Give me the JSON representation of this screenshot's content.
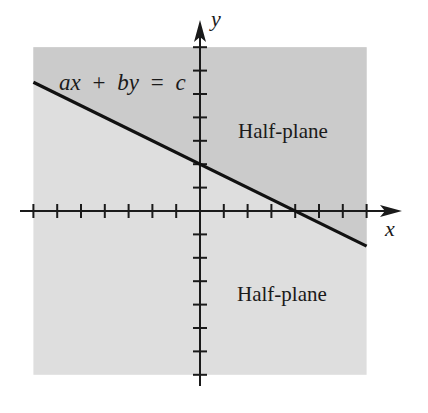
{
  "figure": {
    "width": 428,
    "height": 413,
    "background": "#ffffff",
    "colors": {
      "upper_half_plane": "#cbcbcb",
      "lower_half_plane": "#dedede",
      "line": "#111111",
      "axis": "#1a1a1a",
      "text": "#1a1a1a"
    }
  },
  "labels": {
    "equation": "ax + by = c",
    "equation_parts": [
      "ax",
      "+",
      "by",
      "=",
      "c"
    ],
    "upper_region": "Half-plane",
    "lower_region": "Half-plane",
    "x_axis": "x",
    "y_axis": "y"
  },
  "chart_data": {
    "type": "line",
    "title": "",
    "xlabel": "x",
    "ylabel": "y",
    "xlim": [
      -7,
      7
    ],
    "ylim": [
      -7,
      7
    ],
    "x_ticks": [
      -7,
      -6,
      -5,
      -4,
      -3,
      -2,
      -1,
      1,
      2,
      3,
      4,
      5,
      6,
      7
    ],
    "y_ticks": [
      -7,
      -6,
      -5,
      -4,
      -3,
      -2,
      -1,
      1,
      2,
      3,
      4,
      5,
      6,
      7
    ],
    "tick_labels_shown": false,
    "grid": false,
    "series": [
      {
        "name": "ax + by = c",
        "equation_example": "x + 2y = 4",
        "slope": -0.5,
        "y_intercept": 2,
        "x_intercept": 4,
        "x": [
          -7,
          0,
          4,
          7
        ],
        "y": [
          5.5,
          2,
          0,
          -1.5
        ]
      }
    ],
    "regions": [
      {
        "name": "Half-plane",
        "position": "above line",
        "shade": "darker"
      },
      {
        "name": "Half-plane",
        "position": "below line",
        "shade": "lighter"
      }
    ],
    "annotations": [
      {
        "text": "ax + by = c",
        "x": -5.8,
        "y": 5
      },
      {
        "text": "Half-plane",
        "x": 1.6,
        "y": 3
      },
      {
        "text": "Half-plane",
        "x": 1.6,
        "y": -3.8
      }
    ]
  },
  "layout": {
    "origin_px": [
      200,
      211
    ],
    "unit_px_x": 23.8,
    "unit_px_y": 23.4,
    "x_axis_px": [
      20,
      402
    ],
    "y_axis_px": [
      20,
      386
    ],
    "tick_half_len": 7
  }
}
